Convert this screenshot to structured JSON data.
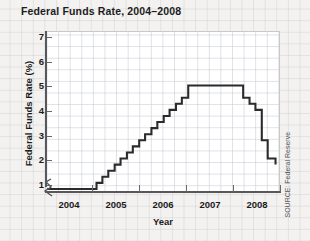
{
  "chart_data": {
    "type": "line",
    "title": "Federal Funds Rate, 2004–2008",
    "xlabel": "Year",
    "ylabel": "Federal Funds Rate (%)",
    "line_style": "step",
    "grid": true,
    "legend": null,
    "y_axis_break": true,
    "xlim": [
      2003.6,
      2008.35
    ],
    "ylim": [
      0.85,
      7.45
    ],
    "y_ticks": [
      1,
      2,
      3,
      4,
      5,
      6,
      7
    ],
    "x_ticks": [
      2004,
      2005,
      2006,
      2007,
      2008
    ],
    "x_tick_labels": [
      "2004",
      "2005",
      "2006",
      "2007",
      "2008"
    ],
    "y_tick_labels": [
      "1",
      "2",
      "3",
      "4",
      "5",
      "6",
      "7"
    ],
    "series_name": "Federal Funds Rate",
    "line_color": "#2b2b2b",
    "x": [
      2003.62,
      2004.5,
      2004.63,
      2004.75,
      2004.87,
      2005.0,
      2005.12,
      2005.25,
      2005.37,
      2005.5,
      2005.62,
      2005.75,
      2005.87,
      2006.0,
      2006.12,
      2006.25,
      2006.37,
      2006.5,
      2007.5,
      2007.62,
      2007.75,
      2007.87,
      2008.0,
      2008.12,
      2008.28
    ],
    "values": [
      1.0,
      1.0,
      1.25,
      1.5,
      1.75,
      2.0,
      2.25,
      2.5,
      2.75,
      3.0,
      3.25,
      3.5,
      3.75,
      4.0,
      4.25,
      4.5,
      4.75,
      5.25,
      5.25,
      4.75,
      4.5,
      4.25,
      3.0,
      2.25,
      2.0
    ],
    "annotations": [
      "SOURCE: Federal Reserve"
    ]
  },
  "credit": {
    "source_text": "SOURCE: Federal Reserve"
  }
}
